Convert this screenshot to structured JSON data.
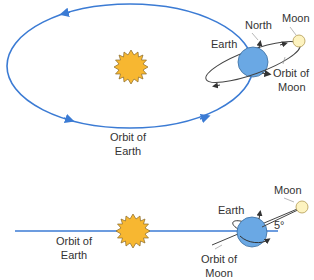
{
  "colors": {
    "orbit_earth": "#3b7bd4",
    "sun_fill": "#f7b731",
    "sun_stroke": "#8a6a2a",
    "earth_fill": "#6aa8e4",
    "earth_stroke": "#3c6d9e",
    "moon_fill": "#fdf3c0",
    "moon_stroke": "#b39a52",
    "moon_orbit": "#444444",
    "text": "#333333"
  },
  "top_view": {
    "labels": {
      "north": "North",
      "moon": "Moon",
      "earth": "Earth",
      "orbit_moon_1": "Orbit of",
      "orbit_moon_2": "Moon",
      "orbit_earth_1": "Orbit of",
      "orbit_earth_2": "Earth"
    }
  },
  "side_view": {
    "labels": {
      "moon": "Moon",
      "earth": "Earth",
      "angle": "5°",
      "orbit_earth_1": "Orbit of",
      "orbit_earth_2": "Earth",
      "orbit_moon_1": "Orbit of",
      "orbit_moon_2": "Moon"
    }
  }
}
